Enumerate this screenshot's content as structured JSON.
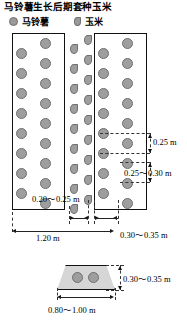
{
  "title": "马铃薯生长后期套种玉米",
  "legend": {
    "items": [
      {
        "label": "马铃薯",
        "icon": "potato-circle-marker",
        "color": "#9a9a9a"
      },
      {
        "label": "玉米",
        "icon": "corn-teardrop-marker",
        "color": "#9a9a9a"
      }
    ]
  },
  "diagram": {
    "type": "agronomy-planting-layout",
    "plan_view": {
      "plots": [
        {
          "name": "potato-plot-left",
          "crop": "马铃薯",
          "rows": 2,
          "plants_per_row": 9
        },
        {
          "name": "potato-plot-right",
          "crop": "马铃薯",
          "rows": 2,
          "plants_per_row": 9
        }
      ],
      "intercrop_strips": [
        {
          "name": "corn-strip-left",
          "crop": "玉米",
          "plants": 9
        },
        {
          "name": "corn-strip-right",
          "crop": "玉米",
          "plants": 9
        }
      ]
    },
    "dimensions": {
      "potato_in_row_spacing": "0.25 m",
      "potato_row_to_row_spacing": "0.25～0.30 m",
      "corn_in_row_spacing": "0.20～0.25 m",
      "ridge_to_ridge_width": "1.20 m",
      "corn_strip_width": "0.30～0.35 m",
      "ridge_height": "0.30～0.35 m",
      "ridge_base_width": "0.80～1.00 m"
    },
    "cross_section": {
      "name": "ridge-cross-section",
      "shape": "trapezoid",
      "plants_on_ridge": 2
    }
  },
  "colors": {
    "plant_fill": "#9e9e9e",
    "plant_stroke": "#707070",
    "ridge_fill": "#d6d6d6",
    "line": "#111111"
  }
}
